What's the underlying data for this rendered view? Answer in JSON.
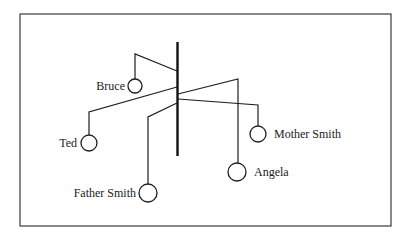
{
  "diagram": {
    "type": "mobile",
    "frame": {
      "x": 20,
      "y": 14,
      "width": 371,
      "height": 212
    },
    "bar": {
      "x": 177.5,
      "y1": 42,
      "y2": 156
    },
    "members": [
      {
        "name": "Bruce",
        "arm": "177,71 135,54 135,79",
        "circle": {
          "cx": 135,
          "cy": 86,
          "r": 7
        },
        "label": {
          "x": 125,
          "y": 89.5,
          "anchor": "end"
        }
      },
      {
        "name": "Ted",
        "arm": "177,87 89,112 89,135",
        "circle": {
          "cx": 89,
          "cy": 143,
          "r": 8
        },
        "label": {
          "x": 77,
          "y": 147,
          "anchor": "end"
        }
      },
      {
        "name": "Father Smith",
        "arm": "177,103 148,117 148,184",
        "circle": {
          "cx": 148,
          "cy": 193,
          "r": 9
        },
        "label": {
          "x": 136,
          "y": 197,
          "anchor": "end"
        }
      },
      {
        "name": "Angela",
        "arm": "178,94 238,79 238,163",
        "circle": {
          "cx": 237,
          "cy": 172,
          "r": 9
        },
        "label": {
          "x": 254,
          "y": 176,
          "anchor": "start"
        }
      },
      {
        "name": "Mother Smith",
        "arm": "178,99 258,105 258,126",
        "circle": {
          "cx": 258,
          "cy": 134,
          "r": 8
        },
        "label": {
          "x": 274,
          "y": 138,
          "anchor": "start"
        }
      }
    ]
  }
}
